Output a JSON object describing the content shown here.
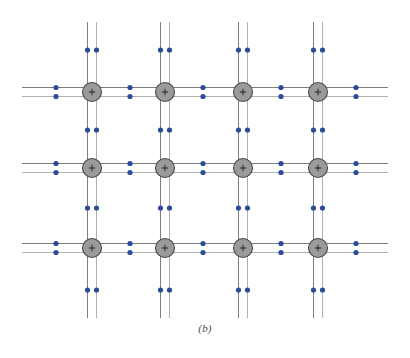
{
  "figure": {
    "caption": "(b)",
    "kind": "lattice-diagram"
  },
  "colors": {
    "background": "#ffffff",
    "grid_line": "#6e6e6e",
    "grid_line_light": "#a8a8a8",
    "ion_fill": "#9a9a9a",
    "ion_stroke": "#4a4a4a",
    "ion_plus": "#2e2e2e",
    "electron": "#2b4c9b",
    "caption_text": "#4a4a4a"
  },
  "geometry": {
    "width": 410,
    "height": 358,
    "rail_gap": 9,
    "ion_radius": 9.5,
    "electron_radius": 2.6,
    "line_width": 0.9,
    "plus_arm": 3.2
  },
  "lattice": {
    "columns_x": [
      92,
      165,
      243,
      318
    ],
    "rows_y": [
      92,
      168,
      248
    ],
    "column_line_top": 22,
    "column_line_bottom": 318,
    "row_line_left": 22,
    "row_line_right": 388,
    "ion_label": "+",
    "ion_count": 12,
    "horizontal_electron_x": [
      56,
      130,
      203,
      281,
      356
    ],
    "vertical_electron_y": [
      50,
      130,
      208,
      290
    ],
    "electron_count": 88
  },
  "legend": {
    "ion_name": "positive-ion-core",
    "electron_name": "delocalized-electron",
    "bond_name": "lattice-bond-rail"
  }
}
